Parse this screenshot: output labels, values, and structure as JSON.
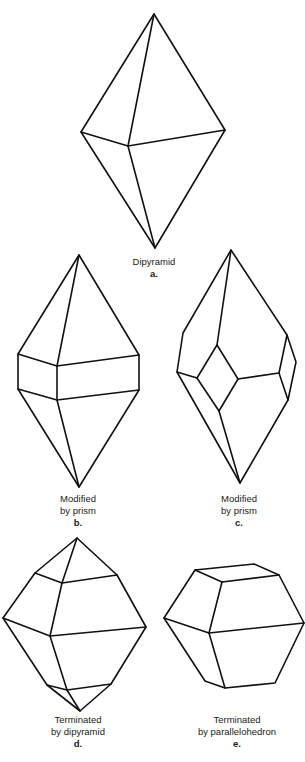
{
  "figures": [
    {
      "id": "a",
      "lines": [
        "Dipyramid"
      ],
      "letter": "a."
    },
    {
      "id": "b",
      "lines": [
        "Modified",
        "by prism"
      ],
      "letter": "b."
    },
    {
      "id": "c",
      "lines": [
        "Modified",
        "by prism"
      ],
      "letter": "c."
    },
    {
      "id": "d",
      "lines": [
        "Terminated",
        "by dipyramid"
      ],
      "letter": "d."
    },
    {
      "id": "e",
      "lines": [
        "Terminated",
        "by parallelohedron"
      ],
      "letter": "e."
    }
  ],
  "colors": {
    "stroke": "#111111",
    "text": "#222222",
    "background": "#ffffff"
  }
}
